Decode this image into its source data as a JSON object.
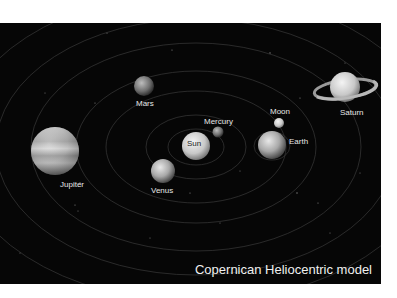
{
  "title": "Copernican Heliocentric model",
  "colors": {
    "background": "#060606",
    "page": "#ffffff",
    "label": "#e6e6e6",
    "orbit": "#3a3a3a"
  },
  "bodies": [
    {
      "name": "Sun",
      "label": "Sun"
    },
    {
      "name": "Mercury",
      "label": "Mercury"
    },
    {
      "name": "Venus",
      "label": "Venus"
    },
    {
      "name": "Earth",
      "label": "Earth"
    },
    {
      "name": "Moon",
      "label": "Moon"
    },
    {
      "name": "Mars",
      "label": "Mars"
    },
    {
      "name": "Jupiter",
      "label": "Jupiter"
    },
    {
      "name": "Saturn",
      "label": "Saturn"
    }
  ]
}
